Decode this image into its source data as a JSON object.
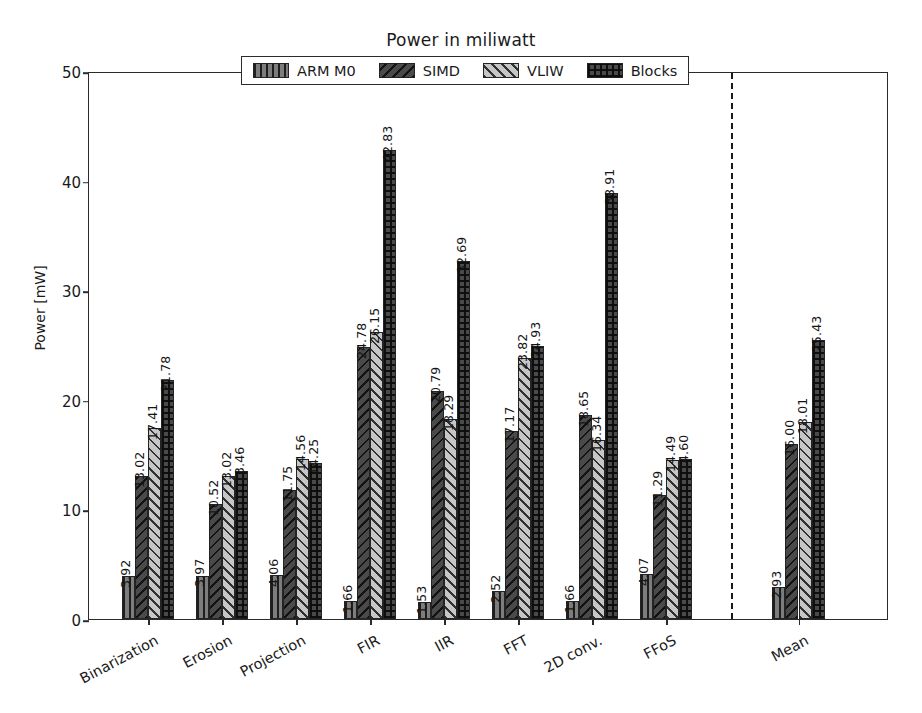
{
  "chart_data": {
    "type": "bar",
    "title": "Power in miliwatt",
    "xlabel": "",
    "ylabel": "Power [mW]",
    "ylim": [
      0,
      50
    ],
    "yticks": [
      0,
      10,
      20,
      30,
      40,
      50
    ],
    "grid": false,
    "legend_position": "upper center",
    "categories": [
      "Binarization",
      "Erosion",
      "Projection",
      "FIR",
      "IIR",
      "FFT",
      "2D conv.",
      "FFoS",
      "Mean"
    ],
    "series": [
      {
        "name": "ARM M0",
        "hatch": "vertical-lines",
        "color": "#7d7d7d",
        "values": [
          3.92,
          3.97,
          4.06,
          1.66,
          1.53,
          2.52,
          1.66,
          4.07,
          2.93
        ],
        "labels": [
          "3.92",
          "3.97",
          "4.06",
          "1.66",
          "1.53",
          "2.52",
          "1.66",
          "4.07",
          "2.93"
        ]
      },
      {
        "name": "SIMD",
        "hatch": "back-diagonal",
        "color": "#4a4a4a",
        "values": [
          13.02,
          10.52,
          11.75,
          24.78,
          20.79,
          17.17,
          18.65,
          11.29,
          16.0
        ],
        "labels": [
          "13.02",
          "10.52",
          "11.75",
          "24.78",
          "20.79",
          "17.17",
          "18.65",
          "11.29",
          "16.00"
        ]
      },
      {
        "name": "VLIW",
        "hatch": "forward-diagonal",
        "color": "#c6c6c6",
        "values": [
          17.41,
          13.02,
          14.56,
          26.15,
          18.29,
          23.82,
          16.34,
          14.49,
          18.01
        ],
        "labels": [
          "17.41",
          "13.02",
          "14.56",
          "26.15",
          "18.29",
          "23.82",
          "16.34",
          "14.49",
          "18.01"
        ]
      },
      {
        "name": "Blocks",
        "hatch": "crosshatch",
        "color": "#4a4a4a",
        "values": [
          21.78,
          13.46,
          14.25,
          42.83,
          32.69,
          24.93,
          38.91,
          14.6,
          25.43
        ],
        "labels": [
          "21.78",
          "13.46",
          "14.25",
          "42.83",
          "32.69",
          "24.93",
          "38.91",
          "14.60",
          "25.43"
        ]
      }
    ],
    "annotations": {
      "divider": "dashed vertical separator before Mean group"
    }
  }
}
